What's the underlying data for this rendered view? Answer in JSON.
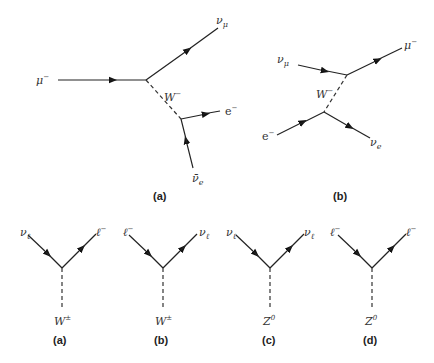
{
  "figure_top": {
    "diagram_a": {
      "caption": "(a)",
      "particles": {
        "incoming_muon": "μ",
        "incoming_muon_charge": "−",
        "outgoing_nu_mu": "ν",
        "outgoing_nu_mu_sub": "μ",
        "boson": "W",
        "boson_charge": "−",
        "electron": "e",
        "electron_charge": "−",
        "antineutrino_e": "ν̄",
        "antineutrino_e_sub": "e"
      }
    },
    "diagram_b": {
      "caption": "(b)",
      "particles": {
        "incoming_nu_mu": "ν",
        "incoming_nu_mu_sub": "μ",
        "outgoing_muon": "μ",
        "outgoing_muon_charge": "−",
        "boson": "W",
        "boson_charge": "−",
        "electron": "e",
        "electron_charge": "−",
        "nu_e": "ν",
        "nu_e_sub": "e"
      }
    }
  },
  "figure_bottom": {
    "vertices": [
      {
        "caption": "(a)",
        "left": "ν",
        "left_sub": "ℓ",
        "left_sup": "",
        "right": "ℓ",
        "right_sub": "",
        "right_sup": "−",
        "boson": "W",
        "boson_sup": "±"
      },
      {
        "caption": "(b)",
        "left": "ℓ",
        "left_sub": "",
        "left_sup": "−",
        "right": "ν",
        "right_sub": "ℓ",
        "right_sup": "",
        "boson": "W",
        "boson_sup": "±"
      },
      {
        "caption": "(c)",
        "left": "ν",
        "left_sub": "ℓ",
        "left_sup": "",
        "right": "ν",
        "right_sub": "ℓ",
        "right_sup": "",
        "boson": "Z",
        "boson_sup": "0"
      },
      {
        "caption": "(d)",
        "left": "ℓ",
        "left_sub": "",
        "left_sup": "−",
        "right": "ℓ",
        "right_sub": "",
        "right_sup": "−",
        "boson": "Z",
        "boson_sup": "0"
      }
    ]
  }
}
